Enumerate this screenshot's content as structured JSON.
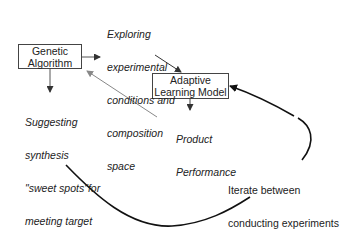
{
  "diagram": {
    "nodes": {
      "genetic_algorithm": {
        "line1": "Genetic",
        "line2": "Algorithm"
      },
      "adaptive_model": {
        "line1": "Adaptive",
        "line2": "Learning Model"
      }
    },
    "labels": {
      "exploring": [
        "Exploring",
        "experimental",
        "conditions and",
        "composition",
        "space"
      ],
      "suggesting": [
        "Suggesting",
        "synthesis",
        "\"sweet spots\"for",
        "meeting target",
        "product",
        "performance"
      ],
      "product_performance": [
        "Product",
        "Performance"
      ],
      "iterate": [
        "Iterate between",
        "conducting experiments",
        "and updating model"
      ]
    },
    "edges": [
      {
        "from": "Genetic Algorithm",
        "to": "Exploring experimental conditions and composition space"
      },
      {
        "from": "Exploring experimental conditions and composition space",
        "to": "Adaptive Learning Model"
      },
      {
        "from": "Adaptive Learning Model",
        "to": "Product Performance"
      },
      {
        "from": "Product Performance",
        "to": "Genetic Algorithm",
        "style": "gray"
      },
      {
        "from": "Genetic Algorithm",
        "to": "Suggesting synthesis sweet spots"
      },
      {
        "from": "Suggesting synthesis sweet spots",
        "to": "Adaptive Learning Model",
        "style": "curved loop",
        "label": "Iterate between conducting experiments and updating model"
      }
    ],
    "colors": {
      "primary_line": "#222222",
      "feedback_line": "#888888"
    }
  }
}
